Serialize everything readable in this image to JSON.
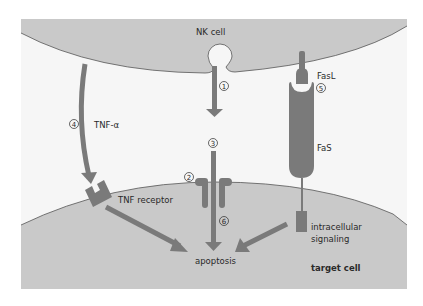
{
  "diagram": {
    "colors": {
      "background": "#ffffff",
      "cell_fill": "#c9c9c9",
      "cell_outline": "#555555",
      "gap_fill": "#f6f6f6",
      "molecule_fill": "#7a7a7a",
      "arrow_fill": "#7a7a7a",
      "text": "#2a2a2a"
    },
    "cells": {
      "nk_cell": "NK cell",
      "target_cell": "target cell"
    },
    "labels": {
      "tnf_alpha": "TNF-α",
      "tnf_receptor": "TNF receptor",
      "fasl": "FasL",
      "fas": "FaS",
      "intracellular_signaling_line1": "intracellular",
      "intracellular_signaling_line2": "signaling",
      "apoptosis": "apoptosis"
    },
    "steps": [
      {
        "id": "step-1",
        "label": "1"
      },
      {
        "id": "step-2",
        "label": "2"
      },
      {
        "id": "step-3",
        "label": "3"
      },
      {
        "id": "step-4",
        "label": "4"
      },
      {
        "id": "step-5",
        "label": "5"
      },
      {
        "id": "step-6",
        "label": "6"
      }
    ]
  }
}
